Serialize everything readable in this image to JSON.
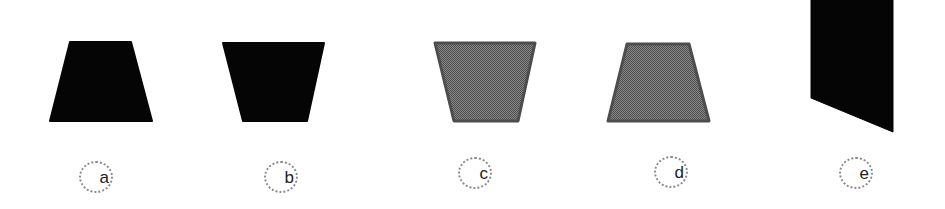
{
  "figure": {
    "width": 945,
    "height": 209,
    "background": "#ffffff",
    "colors": {
      "solid_fill": "#050505",
      "gray_fill": "#6b6b6b",
      "gray_pattern_dark": "#4a4a4a",
      "gray_pattern_light": "#8c8c8c",
      "gray_border": "#4d4d4d",
      "label_ring": "#8a8a8a",
      "label_text": "#222222"
    },
    "options": [
      {
        "id": "a",
        "label": "a",
        "shape": "trapezoid-wide-bottom",
        "fill": "solid",
        "points": "70,42 131,42 152,121 50,121",
        "label_center": [
          96,
          177
        ]
      },
      {
        "id": "b",
        "label": "b",
        "shape": "trapezoid-wide-top",
        "fill": "solid",
        "points": "223,43 324,43 307,121 243,121",
        "label_center": [
          281,
          177
        ]
      },
      {
        "id": "c",
        "label": "c",
        "shape": "trapezoid-wide-top",
        "fill": "gray-dither",
        "points": "435,43 535,43 518,121 454,121",
        "label_center": [
          475,
          173
        ]
      },
      {
        "id": "d",
        "label": "d",
        "shape": "trapezoid-wide-bottom",
        "fill": "gray-dither",
        "points": "627,44 689,44 709,121 608,121",
        "label_center": [
          671,
          172
        ]
      },
      {
        "id": "e",
        "label": "e",
        "shape": "parallelogram-slanted-bottom",
        "fill": "solid",
        "points": "811,0 893,0 893,132 811,98",
        "label_center": [
          856,
          173
        ]
      }
    ]
  }
}
